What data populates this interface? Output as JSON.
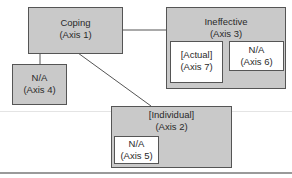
{
  "diagram": {
    "nodes": [
      {
        "id": "coping",
        "title": "Coping",
        "axis": "(Axis 1)"
      },
      {
        "id": "individual",
        "title": "[Individual]",
        "axis": "(Axis 2)"
      },
      {
        "id": "ineffective",
        "title": "Ineffective",
        "axis": "(Axis 3)"
      },
      {
        "id": "axis4",
        "title": "N/A",
        "axis": "(Axis 4)"
      },
      {
        "id": "axis5",
        "title": "N/A",
        "axis": "(Axis 5)"
      },
      {
        "id": "axis6",
        "title": "N/A",
        "axis": "(Axis 6)"
      },
      {
        "id": "actual",
        "title": "[Actual]",
        "axis": "(Axis 7)"
      }
    ],
    "edges": [
      {
        "from": "coping",
        "to": "ineffective"
      },
      {
        "from": "coping",
        "to": "axis4"
      },
      {
        "from": "coping",
        "to": "individual"
      }
    ],
    "colors": {
      "box_fill": "#c9c9c9",
      "inner_fill": "#ffffff",
      "border": "#555555",
      "line": "#555555"
    }
  }
}
